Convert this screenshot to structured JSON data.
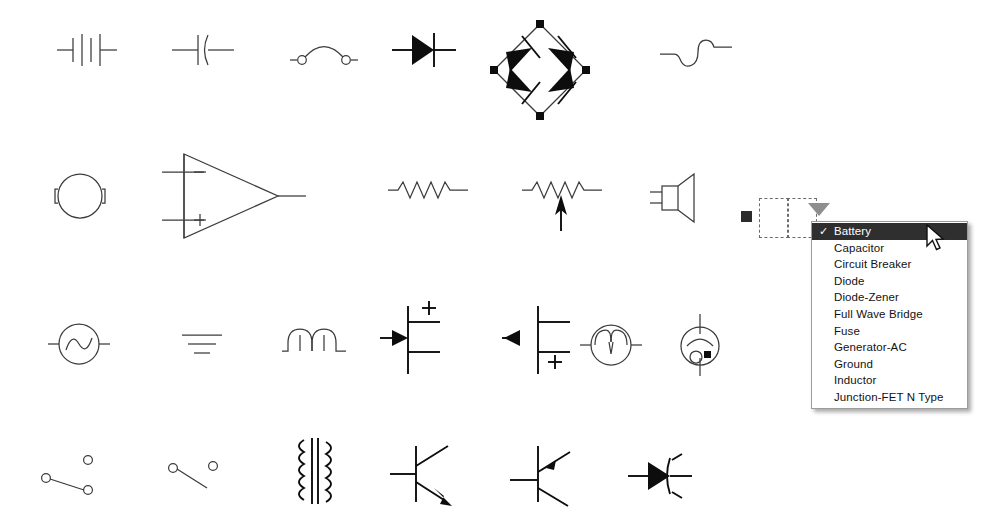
{
  "app": {
    "kind": "electrical-symbol-palette",
    "background_color": "#ffffff",
    "line_color": "#3b3b3b",
    "fill_color": "#0d0d0d"
  },
  "canvas": {
    "label": "Electrical symbols palette",
    "rows": [
      {
        "row": 1,
        "symbols": [
          {
            "name": "battery",
            "label": "Battery"
          },
          {
            "name": "capacitor",
            "label": "Capacitor"
          },
          {
            "name": "circuit-breaker",
            "label": "Circuit Breaker"
          },
          {
            "name": "diode",
            "label": "Diode"
          },
          {
            "name": "full-wave-bridge",
            "label": "Full Wave Bridge"
          },
          {
            "name": "fuse",
            "label": "Fuse"
          }
        ]
      },
      {
        "row": 2,
        "symbols": [
          {
            "name": "lamp",
            "label": "Lamp"
          },
          {
            "name": "operational-amplifier",
            "label": "Op-Amp"
          },
          {
            "name": "resistor",
            "label": "Resistor"
          },
          {
            "name": "resistor-variable",
            "label": "Resistor-Variable"
          },
          {
            "name": "speaker",
            "label": "Speaker"
          }
        ]
      },
      {
        "row": 3,
        "symbols": [
          {
            "name": "generator-ac",
            "label": "Generator-AC"
          },
          {
            "name": "ground",
            "label": "Ground"
          },
          {
            "name": "inductor",
            "label": "Inductor"
          },
          {
            "name": "junction-fet-n-type",
            "label": "Junction-FET N Type"
          },
          {
            "name": "junction-fet-p-type",
            "label": "Junction-FET P Type"
          },
          {
            "name": "motor",
            "label": "Motor"
          },
          {
            "name": "vacuum-tube",
            "label": "Vacuum Tube"
          }
        ]
      },
      {
        "row": 4,
        "symbols": [
          {
            "name": "switch-spdt",
            "label": "Switch-SPDT"
          },
          {
            "name": "switch-spst",
            "label": "Switch-SPST"
          },
          {
            "name": "transformer",
            "label": "Transformer"
          },
          {
            "name": "transistor-npn",
            "label": "Transistor-NPN"
          },
          {
            "name": "transistor-pnp",
            "label": "Transistor-PNP"
          },
          {
            "name": "thyristor",
            "label": "Thyristor"
          }
        ]
      }
    ]
  },
  "selection": {
    "handle_icon": "resize-handle-icon",
    "marquee_icon": "selection-marquee-icon",
    "dropdown_arrow_icon": "triangle-down-icon",
    "dropdown_arrow_color": "#8e8e8e"
  },
  "dropdown": {
    "name": "symbol-type-dropdown",
    "selected_value": "Battery",
    "check_glyph": "✓",
    "highlight_color": "#2f2f2f",
    "highlight_text_color": "#ffffff",
    "items": [
      {
        "label": "Battery",
        "selected": true
      },
      {
        "label": "Capacitor",
        "selected": false
      },
      {
        "label": "Circuit Breaker",
        "selected": false
      },
      {
        "label": "Diode",
        "selected": false
      },
      {
        "label": "Diode-Zener",
        "selected": false
      },
      {
        "label": "Full Wave Bridge",
        "selected": false
      },
      {
        "label": "Fuse",
        "selected": false
      },
      {
        "label": "Generator-AC",
        "selected": false
      },
      {
        "label": "Ground",
        "selected": false
      },
      {
        "label": "Inductor",
        "selected": false
      },
      {
        "label": "Junction-FET N Type",
        "selected": false
      }
    ]
  },
  "cursor": {
    "name": "mouse-pointer-icon",
    "x": 925,
    "y": 224
  }
}
